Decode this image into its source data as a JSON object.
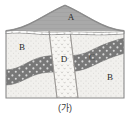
{
  "figure": {
    "caption": "(가)",
    "kind": "geologic-cross-section",
    "frame_color": "#8a8a8a",
    "background": "#ffffff"
  },
  "units": [
    {
      "id": "A",
      "label": "A",
      "role": "top-layer-above-unconformity",
      "pattern": "solid-grey",
      "color": "#a8a8a8",
      "label_x": 71,
      "label_y": 18
    },
    {
      "id": "B-left",
      "label": "B",
      "role": "stippled-sedimentary-layer",
      "pattern": "fine-stipple",
      "color": "#f0efec",
      "label_x": 22,
      "label_y": 48
    },
    {
      "id": "B-right",
      "label": "B",
      "role": "stippled-sedimentary-layer",
      "pattern": "fine-stipple",
      "color": "#f0efec",
      "label_x": 110,
      "label_y": 78
    },
    {
      "id": "C",
      "label": "C",
      "role": "dark-speckled-band",
      "pattern": "dark-dotted",
      "color": "#767676",
      "label_x": 92,
      "label_y": 58
    },
    {
      "id": "D",
      "label": "D",
      "role": "vertical-dike-band",
      "pattern": "light-dotted",
      "color": "#f6f5f2",
      "label_x": 64,
      "label_y": 60
    }
  ],
  "features": [
    {
      "name": "unconformity",
      "type": "wavy-dashed-conglomerate-line"
    },
    {
      "name": "fault-left",
      "type": "dike-boundary-line"
    },
    {
      "name": "fault-right",
      "type": "dike-boundary-line"
    }
  ],
  "colors": {
    "layer_a": "#a8a8a8",
    "layer_b": "#f0efec",
    "layer_c": "#767676",
    "layer_d": "#f6f5f2",
    "outline": "#8a8a8a",
    "text": "#2b2b2b"
  }
}
